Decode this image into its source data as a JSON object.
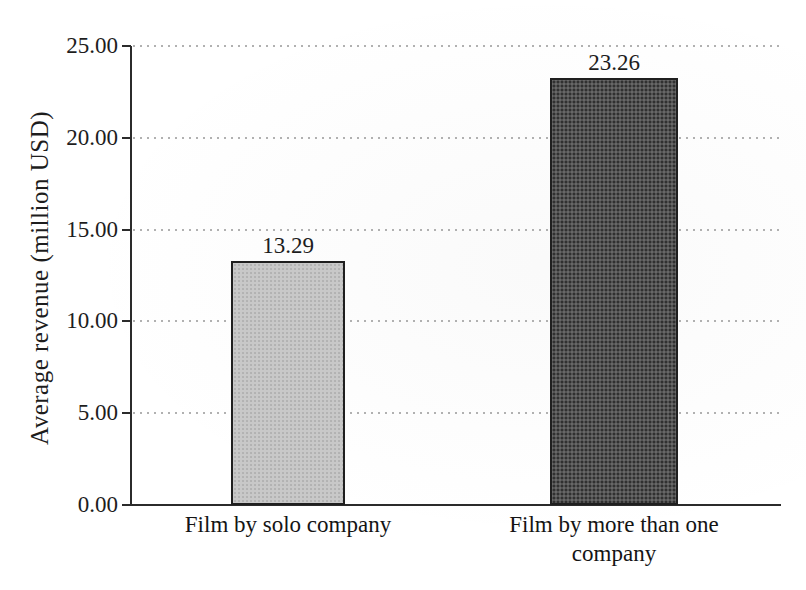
{
  "chart_data": {
    "type": "bar",
    "title": "",
    "categories": [
      "Film by solo company",
      "Film by more than one company"
    ],
    "values": [
      13.29,
      23.26
    ],
    "value_labels": [
      "13.29",
      "23.26"
    ],
    "xlabel": "",
    "ylabel": "Average revenue (million USD)",
    "ylim": [
      0,
      25
    ],
    "ytick_step": 5,
    "ytick_labels": [
      "0.00",
      "5.00",
      "10.00",
      "15.00",
      "20.00",
      "25.00"
    ],
    "grid": "horizontal dotted",
    "legend_position": "none",
    "bar_fill_colors": [
      "#c8c8c8",
      "#525252"
    ],
    "bar_border_color": "#1f1f1f"
  },
  "colors": {
    "background": "#ffffff",
    "axis": "#2b2b2b",
    "gridline_dots": "#a3a3a3",
    "text": "#1d1d1d"
  }
}
